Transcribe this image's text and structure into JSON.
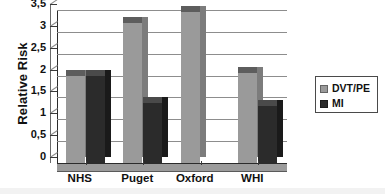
{
  "chart_data": {
    "type": "bar",
    "title": "",
    "subtitle": "",
    "xlabel": "",
    "ylabel": "Relative Risk",
    "categories": [
      "NHS",
      "Puget",
      "Oxford",
      "WHI"
    ],
    "series": [
      {
        "name": "DVT/PE",
        "color": "#9a9a9a",
        "values": [
          2.0,
          3.2,
          3.45,
          2.05
        ]
      },
      {
        "name": "MI",
        "color": "#2b2b2b",
        "values": [
          2.0,
          1.37,
          null,
          1.3
        ]
      }
    ],
    "ylim": [
      0,
      3.5
    ],
    "ytick_values": [
      0,
      0.5,
      1,
      1.5,
      2,
      2.5,
      3,
      3.5
    ],
    "ytick_labels": [
      "0",
      "0,5",
      "1",
      "1,5",
      "2",
      "2,5",
      "3",
      "3,5"
    ],
    "grid": true,
    "grid_axis": "y",
    "legend_position": "right",
    "style_3d": true,
    "decimal_separator": ","
  },
  "legend": {
    "items": [
      {
        "label": "DVT/PE",
        "color": "#9a9a9a",
        "swatch": "legend-swatch-dvt-pe"
      },
      {
        "label": "MI",
        "color": "#2b2b2b",
        "swatch": "legend-swatch-mi"
      }
    ]
  },
  "colors": {
    "series_dvt_pe": "#9a9a9a",
    "series_dvt_pe_top": "#5d5d5d",
    "series_dvt_pe_side": "#7c7c7c",
    "series_mi": "#2b2b2b",
    "series_mi_top": "#4a4a4a",
    "series_mi_side": "#1a1a1a",
    "gridline": "#8d8d8d",
    "axis": "#2b2b2b",
    "text": "#111111",
    "background": "#ffffff",
    "floor": "#9b9b9b"
  }
}
